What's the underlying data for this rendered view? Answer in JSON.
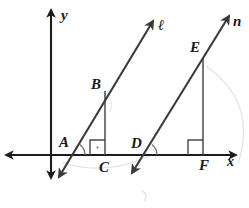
{
  "figure": {
    "kind": "coordinate-geometry-diagram",
    "width": 249,
    "height": 208,
    "background_color": "#ffffff",
    "stroke_color": "#2b2b2b",
    "axis_color": "#1c1c1c",
    "faint_color": "#b9b9b9"
  },
  "axes": {
    "x_axis": {
      "label": "x",
      "label_x": 227,
      "label_y": 166,
      "y": 155,
      "x_start": 6,
      "x_end": 236,
      "arrow_left": true,
      "arrow_right": true
    },
    "y_axis": {
      "label": "y",
      "label_x": 61,
      "label_y": 20,
      "x": 51,
      "y_start": 10,
      "y_end": 178,
      "arrow_up": true,
      "arrow_down": true
    }
  },
  "lines": [
    {
      "name": "l",
      "label": "ℓ",
      "label_x": 158,
      "label_y": 30,
      "x1": 59,
      "y1": 177,
      "x2": 153,
      "y2": 21,
      "arrow_start": true,
      "arrow_end": true
    },
    {
      "name": "n",
      "label": "n",
      "label_x": 233,
      "label_y": 26,
      "x1": 132,
      "y1": 173,
      "x2": 229,
      "y2": 16,
      "arrow_start": true,
      "arrow_end": true
    }
  ],
  "segments": [
    {
      "name": "BC",
      "x1": 105,
      "y1": 91,
      "x2": 105,
      "y2": 155
    },
    {
      "name": "EF",
      "x1": 203,
      "y1": 59,
      "x2": 203,
      "y2": 155
    }
  ],
  "points": [
    {
      "name": "A",
      "label": "A",
      "x": 72,
      "y": 155,
      "label_x": 59,
      "label_y": 147
    },
    {
      "name": "B",
      "label": "B",
      "x": 105,
      "y": 91,
      "label_x": 91,
      "label_y": 89
    },
    {
      "name": "C",
      "label": "C",
      "x": 105,
      "y": 155,
      "label_x": 99,
      "label_y": 172
    },
    {
      "name": "D",
      "label": "D",
      "x": 144,
      "y": 155,
      "label_x": 131,
      "label_y": 148
    },
    {
      "name": "E",
      "label": "E",
      "x": 203,
      "y": 59,
      "label_x": 190,
      "label_y": 52
    },
    {
      "name": "F",
      "label": "F",
      "x": 203,
      "y": 155,
      "label_x": 199,
      "label_y": 170
    }
  ],
  "right_angle_marks": [
    {
      "at": "C",
      "x": 90,
      "y": 140,
      "size": 15
    },
    {
      "at": "F",
      "x": 188,
      "y": 140,
      "size": 15
    }
  ],
  "angle_arcs": [
    {
      "at": "A",
      "cx": 72,
      "cy": 155,
      "r": 13
    },
    {
      "at": "D",
      "cx": 144,
      "cy": 155,
      "r": 13
    }
  ],
  "faint_marks": [
    {
      "name": "arc-near-C",
      "cx": 105,
      "cy": 160,
      "rx": 44,
      "ry": 12,
      "rotate": -6
    },
    {
      "name": "arc-near-E",
      "cx": 213,
      "cy": 120,
      "rx": 44,
      "ry": 58,
      "rotate": 0
    },
    {
      "name": "arc-near-B",
      "cx": 110,
      "cy": 100,
      "rx": 13,
      "ry": 10,
      "rotate": 0
    },
    {
      "name": "stray-below",
      "cx": 145,
      "cy": 196,
      "rx": 4,
      "ry": 6,
      "rotate": 0
    }
  ]
}
